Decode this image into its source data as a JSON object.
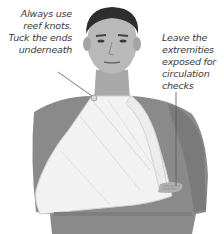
{
  "figure": {
    "annotations": [
      {
        "id": "reef-knots",
        "lines": [
          "Always use",
          "reef knots.",
          "Tuck the ends",
          "underneath"
        ]
      },
      {
        "id": "extremities",
        "lines": [
          "Leave the",
          "extremities",
          "exposed for",
          "circulation",
          "checks"
        ]
      }
    ]
  },
  "colors": {
    "background": "#ffffff",
    "shirt": "#8a8a8a",
    "sling": "#f2f2f2",
    "skin": "#b9b9b9",
    "hair": "#2e2e2e",
    "text": "#3a3a3a",
    "leader_line": "#555555"
  }
}
